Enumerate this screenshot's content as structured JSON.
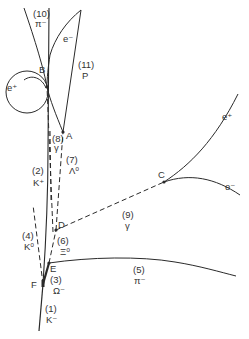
{
  "diagram": {
    "colors": {
      "line": "#2a2a2a",
      "text": "#333333",
      "background": "#ffffff"
    },
    "vertices": {
      "A": {
        "label": "A",
        "x": 63,
        "y": 132
      },
      "B": {
        "label": "B",
        "x": 47,
        "y": 87
      },
      "C": {
        "label": "C",
        "x": 164,
        "y": 182
      },
      "D": {
        "label": "D",
        "x": 56,
        "y": 230
      },
      "E": {
        "label": "E",
        "x": 49,
        "y": 263
      },
      "F": {
        "label": "F",
        "x": 43,
        "y": 284
      }
    },
    "tracks": [
      {
        "id": "1",
        "num": "(1)",
        "particle": "K⁻",
        "style": "solid"
      },
      {
        "id": "2",
        "num": "(2)",
        "particle": "K⁺",
        "style": "solid"
      },
      {
        "id": "3",
        "num": "(3)",
        "particle": "Ω⁻",
        "style": "solid"
      },
      {
        "id": "4",
        "num": "(4)",
        "particle": "K⁰",
        "style": "dashed"
      },
      {
        "id": "5",
        "num": "(5)",
        "particle": "π⁻",
        "style": "solid"
      },
      {
        "id": "6",
        "num": "(6)",
        "particle": "Ξ⁰",
        "style": "dashed"
      },
      {
        "id": "7",
        "num": "(7)",
        "particle": "Λ⁰",
        "style": "dashed"
      },
      {
        "id": "8",
        "num": "(8)",
        "particle": "γ",
        "style": "dashed"
      },
      {
        "id": "9",
        "num": "(9)",
        "particle": "γ",
        "style": "dashed"
      },
      {
        "id": "10",
        "num": "(10)",
        "particle": "π⁻",
        "style": "solid"
      },
      {
        "id": "11",
        "num": "(11)",
        "particle": "P",
        "style": "solid"
      }
    ],
    "pair_labels": {
      "B_positron": "e⁺",
      "B_electron": "e⁻",
      "C_positron": "e⁺",
      "C_electron": "e⁻"
    }
  }
}
